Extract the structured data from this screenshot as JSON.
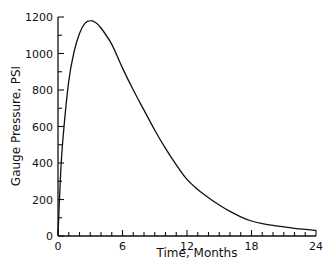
{
  "chart_data": {
    "type": "line",
    "title": "",
    "xlabel": "Time,  Months",
    "ylabel": "Gauge  Pressure,  PSI",
    "xlim": [
      0,
      24
    ],
    "ylim": [
      0,
      1200
    ],
    "x_ticks": [
      0,
      6,
      12,
      18,
      24
    ],
    "x_minor_tick_step": 1,
    "y_ticks": [
      0,
      200,
      400,
      600,
      800,
      1000,
      1200
    ],
    "y_minor_tick_step": 100,
    "grid": false,
    "legend": null,
    "series": [
      {
        "name": "Gauge Pressure",
        "color": "#111111",
        "x": [
          0,
          0.25,
          0.5,
          1,
          1.5,
          2,
          2.5,
          3,
          3.5,
          4,
          5,
          6,
          7,
          8,
          9,
          10,
          11,
          12,
          13,
          14,
          15,
          16,
          17,
          18,
          19,
          20,
          21,
          22,
          23,
          24
        ],
        "values": [
          0,
          350,
          560,
          850,
          1010,
          1110,
          1165,
          1180,
          1170,
          1140,
          1050,
          920,
          800,
          690,
          580,
          480,
          390,
          310,
          255,
          210,
          170,
          135,
          105,
          82,
          68,
          58,
          50,
          42,
          36,
          30
        ]
      }
    ]
  }
}
